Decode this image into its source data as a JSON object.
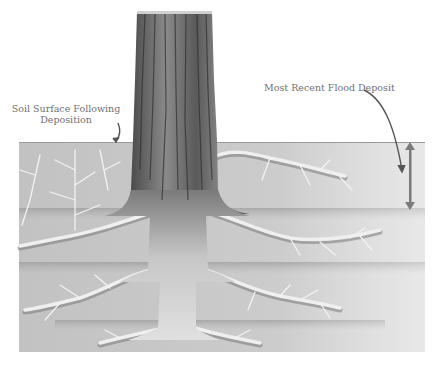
{
  "figure": {
    "labels": {
      "soil_surface_line1": "Soil Surface Following",
      "soil_surface_line2": "Deposition",
      "flood_deposit": "Most Recent Flood Deposit"
    },
    "colors": {
      "background": "#ffffff",
      "soil_light": "#d6d6d6",
      "soil_mid": "#bdbdbd",
      "soil_band": "#9a9a9a",
      "root": "#eeeeee",
      "root_shadow": "#7a7a7a",
      "trunk_dark": "#3a3a3a",
      "trunk_light": "#bcbcbc",
      "arrow": "#7a7a7a",
      "label_text": "#6f6f6f"
    },
    "soil_layers": 4,
    "icons": {
      "depth_arrow": "double-headed-vertical-arrow",
      "pointer_arrows": "curved-arrow"
    }
  }
}
